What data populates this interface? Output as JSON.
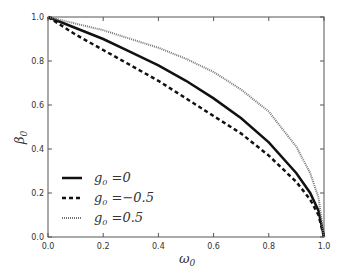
{
  "chart_data": {
    "type": "line",
    "title": "",
    "xlabel": "ω0",
    "ylabel": "β0",
    "xlim": [
      0.0,
      1.0
    ],
    "ylim": [
      0.0,
      1.0
    ],
    "grid": false,
    "legend_position": "lower left",
    "xticks": [
      "0.0",
      "0.2",
      "0.4",
      "0.6",
      "0.8",
      "1.0"
    ],
    "yticks": [
      "0.0",
      "0.2",
      "0.4",
      "0.6",
      "0.8",
      "1.0"
    ],
    "x": [
      0.0,
      0.1,
      0.2,
      0.3,
      0.4,
      0.5,
      0.6,
      0.7,
      0.8,
      0.9,
      0.95,
      0.98,
      1.0
    ],
    "series": [
      {
        "name": "g0 =0",
        "style": "solid",
        "values": [
          1.0,
          0.95,
          0.9,
          0.84,
          0.78,
          0.71,
          0.63,
          0.54,
          0.43,
          0.29,
          0.2,
          0.12,
          0.0
        ]
      },
      {
        "name": "g0 =−0.5",
        "style": "dashed",
        "values": [
          1.0,
          0.92,
          0.85,
          0.78,
          0.71,
          0.63,
          0.55,
          0.47,
          0.37,
          0.25,
          0.17,
          0.1,
          0.0
        ]
      },
      {
        "name": "g0 =0.5",
        "style": "dotted",
        "values": [
          1.0,
          0.97,
          0.94,
          0.9,
          0.86,
          0.81,
          0.75,
          0.67,
          0.57,
          0.41,
          0.29,
          0.18,
          0.0
        ]
      }
    ]
  },
  "legend": {
    "items": [
      {
        "label_base": "g",
        "label_sub": "0",
        "label_rest": " =0"
      },
      {
        "label_base": "g",
        "label_sub": "0",
        "label_rest": " =−0.5"
      },
      {
        "label_base": "g",
        "label_sub": "0",
        "label_rest": " =0.5"
      }
    ]
  },
  "axes": {
    "xlabel_base": "ω",
    "xlabel_sub": "0",
    "ylabel_base": "β",
    "ylabel_sub": "0"
  }
}
